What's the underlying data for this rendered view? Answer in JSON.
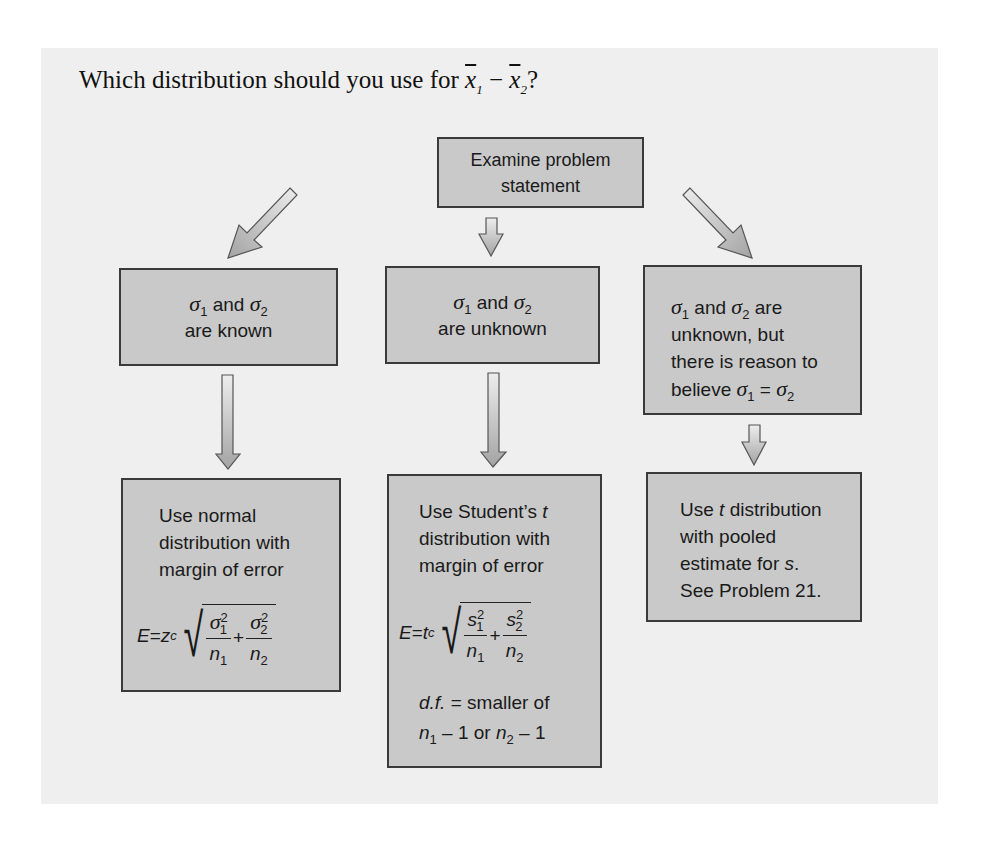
{
  "title": {
    "prefix": "Which distribution should you use for ",
    "x1": "x",
    "x1_sub": "1",
    "minus": " − ",
    "x2": "x",
    "x2_sub": "2",
    "suffix": "?"
  },
  "colors": {
    "panel_bg": "#efefef",
    "box_fill": "#c9c9c9",
    "box_border": "#3a3a3a",
    "arrow_fill_top": "#e6e6e6",
    "arrow_fill_bottom": "#a8a8a8"
  },
  "nodes": {
    "start": {
      "label": "Examine problem statement"
    },
    "known": {
      "sigma": "σ",
      "s1": "1",
      "and": " and ",
      "s2": "2",
      "line2": "are known"
    },
    "unknown": {
      "sigma": "σ",
      "s1": "1",
      "and": " and ",
      "s2": "2",
      "line2": "are unknown"
    },
    "equal": {
      "sigma": "σ",
      "s1": "1",
      "and": " and ",
      "s2": "2",
      "are": " are",
      "line2": "unknown, but",
      "line3": "there is reason to",
      "line4_prefix": "believe ",
      "eq": " = "
    },
    "normal": {
      "line1": "Use normal",
      "line2": "distribution with",
      "line3": "margin of error",
      "formula": {
        "lhs": "E",
        "eq": " = ",
        "crit": "z",
        "crit_sub": "c",
        "num1": "σ",
        "num1_sub": "1",
        "num1_sup": "2",
        "den1": "n",
        "den1_sub": "1",
        "plus": "+",
        "num2": "σ",
        "num2_sub": "2",
        "num2_sup": "2",
        "den2": "n",
        "den2_sub": "2"
      }
    },
    "student": {
      "line1": "Use Student’s ",
      "line1_t": "t",
      "line2": "distribution with",
      "line3": "margin of error",
      "formula": {
        "lhs": "E",
        "eq": " = ",
        "crit": "t",
        "crit_sub": "c",
        "num1": "s",
        "num1_sub": "1",
        "num1_sup": "2",
        "den1": "n",
        "den1_sub": "1",
        "plus": "+",
        "num2": "s",
        "num2_sub": "2",
        "num2_sup": "2",
        "den2": "n",
        "den2_sub": "2"
      },
      "df_label": "d.f.",
      "df_text": " = smaller of",
      "df_n1": "n",
      "df_n1_sub": "1",
      "df_minus1": " – 1 or ",
      "df_n2": "n",
      "df_n2_sub": "2",
      "df_minus2": " – 1"
    },
    "pooled": {
      "line1_prefix": "Use ",
      "line1_t": "t",
      "line1_suffix": " distribution",
      "line2": "with pooled",
      "line3_prefix": "estimate for ",
      "line3_s": "s",
      "line3_suffix": ".",
      "line4": "See Problem 21."
    }
  }
}
